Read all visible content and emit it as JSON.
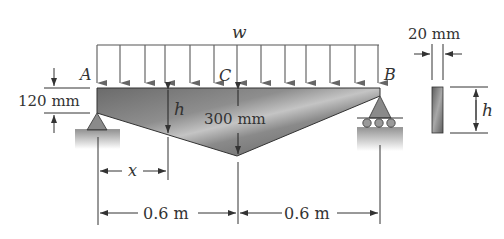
{
  "figure": {
    "load": {
      "symbol": "w"
    },
    "points": {
      "left_support": "A",
      "midspan": "C",
      "right_support": "B"
    },
    "dimensions": {
      "end_depth": "120 mm",
      "mid_depth": "300 mm",
      "variable_depth": "h",
      "position": "x",
      "left_span": "0.6 m",
      "right_span": "0.6 m",
      "section_width": "20 mm",
      "section_height": "h"
    },
    "colors": {
      "line": "#333333",
      "beam_dark": "#555555",
      "beam_light": "#bdbdbd",
      "support": "#8a8a8a"
    },
    "load_arrow_count": 13
  }
}
